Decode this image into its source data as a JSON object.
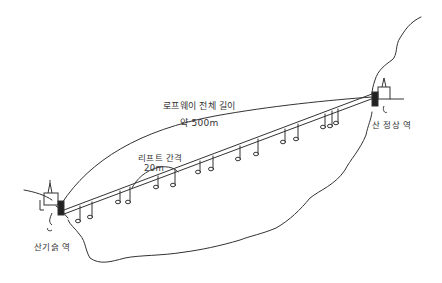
{
  "diagram": {
    "type": "hand-drawn ropeway sketch",
    "stations": {
      "bottom": {
        "label": "산기슭 역"
      },
      "top": {
        "label": "산 정상 역"
      }
    },
    "annotations": {
      "total_length_line1": "로프웨이 전체 길이",
      "total_length_line2": "약 500m",
      "lift_spacing_line1": "리프트 간격",
      "lift_spacing_line2": "20m"
    },
    "colors": {
      "ink": "#333333",
      "background": "#ffffff"
    },
    "chair_count": 24
  }
}
